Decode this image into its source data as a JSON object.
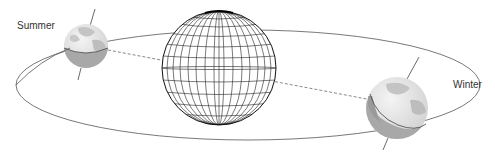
{
  "diagram": {
    "labels": {
      "summer": "Summer",
      "winter": "Winter"
    },
    "elements": {
      "sun": "central globe with latitude/longitude grid",
      "orbit": "elliptical orbit path",
      "earth_summer": "Earth with tilted axis, left side of orbit",
      "earth_winter": "Earth with tilted axis, right side of orbit",
      "sun_earth_line": "dashed line connecting Earth positions through the sun"
    },
    "colors": {
      "line": "#555555",
      "grid": "#222222",
      "earth_land": "#b5b5b5",
      "earth_ocean": "#e2e2e2",
      "earth_shadow": "#9a9a9a"
    }
  }
}
